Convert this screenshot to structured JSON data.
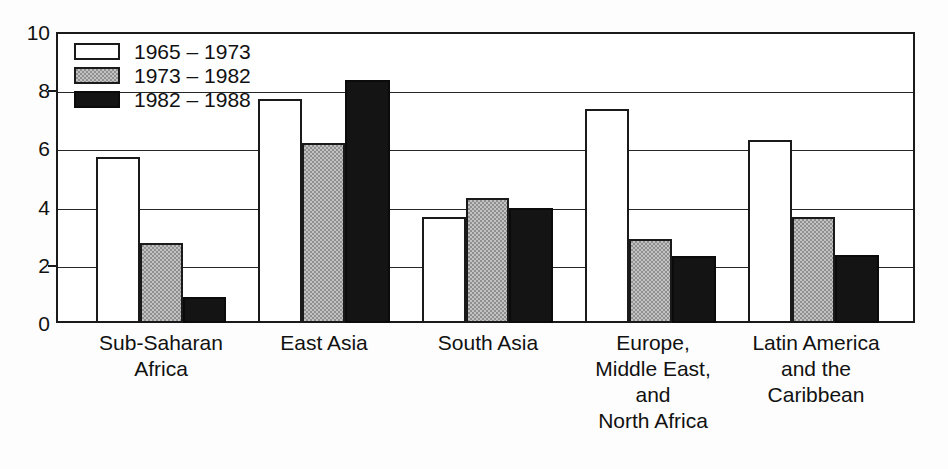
{
  "chart_data": {
    "type": "bar",
    "title": "",
    "subtitle": "",
    "xlabel": "",
    "ylabel": "",
    "ylim": [
      0,
      10
    ],
    "yticks": [
      0,
      2,
      4,
      6,
      8,
      10
    ],
    "ytick_labels": [
      "0",
      "2",
      "4",
      "6",
      "8",
      "10"
    ],
    "grid": true,
    "grid_axis": "y",
    "legend_position": "top-left-inside",
    "categories": [
      "Sub-Saharan Africa",
      "East Asia",
      "South Asia",
      "Europe, Middle East, and North Africa",
      "Latin America and the Caribbean"
    ],
    "category_label_lines": [
      [
        "Sub-Saharan",
        "Africa"
      ],
      [
        "East Asia"
      ],
      [
        "South Asia"
      ],
      [
        "Europe,",
        "Middle East,",
        "and",
        "North Africa"
      ],
      [
        "Latin America",
        "and the",
        "Caribbean"
      ]
    ],
    "series": [
      {
        "name": "1965 – 1973",
        "color": "#ffffff",
        "values": [
          5.7,
          7.7,
          3.65,
          7.35,
          6.3
        ]
      },
      {
        "name": "1973 – 1982",
        "color": "#8f8f8f",
        "values": [
          2.75,
          6.2,
          4.3,
          2.9,
          3.65
        ]
      },
      {
        "name": "1982 – 1988",
        "color": "#141414",
        "values": [
          0.9,
          8.35,
          3.95,
          2.3,
          2.35
        ]
      }
    ]
  },
  "legend": {
    "items": [
      {
        "label": "1965 – 1973",
        "swatch": "white-swatch"
      },
      {
        "label": "1973 – 1982",
        "swatch": "gray-swatch"
      },
      {
        "label": "1982 – 1988",
        "swatch": "black-swatch"
      }
    ]
  },
  "colors": {
    "axis": "#1a1a1a",
    "grid": "#262626",
    "series_white": "#ffffff",
    "series_gray": "#8f8f8f",
    "series_black": "#141414",
    "background": "#ffffff",
    "text": "#111111"
  }
}
